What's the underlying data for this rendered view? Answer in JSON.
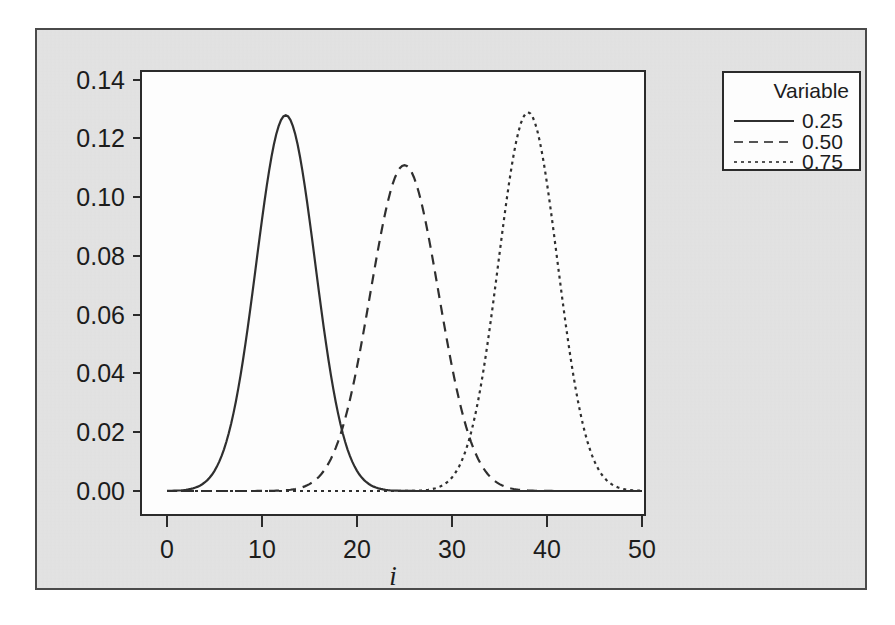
{
  "figure": {
    "panel_background": "#e3e3e3",
    "plot_background": "#fdfdfd",
    "border_color": "#4a4a4a"
  },
  "legend": {
    "title": "Variable",
    "entries": [
      {
        "label": "0.25",
        "style": "solid"
      },
      {
        "label": "0.50",
        "style": "dashed"
      },
      {
        "label": "0.75",
        "style": "dotted"
      }
    ]
  },
  "axes": {
    "x_label": "i",
    "y_label": "",
    "x_ticks": [
      "0",
      "10",
      "20",
      "30",
      "40",
      "50"
    ],
    "y_ticks": [
      "0.00",
      "0.02",
      "0.04",
      "0.06",
      "0.08",
      "0.10",
      "0.12",
      "0.14"
    ]
  },
  "chart_data": {
    "type": "line",
    "title": "",
    "subtitle": "",
    "xlabel": "i",
    "ylabel": "",
    "xlim": [
      0,
      50
    ],
    "ylim": [
      0.0,
      0.14
    ],
    "xticks": [
      0,
      10,
      20,
      30,
      40,
      50
    ],
    "yticks": [
      0.0,
      0.02,
      0.04,
      0.06,
      0.08,
      0.1,
      0.12,
      0.14
    ],
    "grid": false,
    "legend_position": "right-top",
    "legend_title": "Variable",
    "series": [
      {
        "name": "0.25",
        "linestyle": "solid",
        "color": "#2f2f2f",
        "peak_x": 12.5,
        "peak_y": 0.128,
        "sigma": 3.1,
        "x": [
          0,
          2,
          4,
          6,
          8,
          10,
          12,
          12.5,
          14,
          16,
          18,
          20,
          22,
          24,
          26,
          28,
          30,
          35,
          40,
          45,
          50
        ],
        "y": [
          0.0,
          0.0,
          0.0007,
          0.0062,
          0.0256,
          0.0719,
          0.1258,
          0.128,
          0.1175,
          0.0673,
          0.0258,
          0.0066,
          0.0011,
          0.0001,
          0.0,
          0.0,
          0.0,
          0.0,
          0.0,
          0.0,
          0.0
        ]
      },
      {
        "name": "0.50",
        "linestyle": "dashed",
        "color": "#555555",
        "peak_x": 25.0,
        "peak_y": 0.111,
        "sigma": 3.6,
        "x": [
          0,
          5,
          10,
          12,
          14,
          16,
          18,
          20,
          22,
          24,
          25,
          26,
          28,
          30,
          32,
          34,
          36,
          38,
          40,
          45,
          50
        ],
        "y": [
          0.0,
          0.0,
          0.0,
          0.0001,
          0.0009,
          0.0052,
          0.02,
          0.0533,
          0.0932,
          0.1097,
          0.111,
          0.108,
          0.0813,
          0.0441,
          0.0161,
          0.004,
          0.0007,
          0.0001,
          0.0,
          0.0,
          0.0
        ]
      },
      {
        "name": "0.75",
        "linestyle": "dotted",
        "color": "#555555",
        "peak_x": 38.0,
        "peak_y": 0.129,
        "sigma": 3.1,
        "x": [
          0,
          5,
          10,
          15,
          20,
          25,
          28,
          30,
          32,
          34,
          36,
          38,
          40,
          42,
          44,
          46,
          48,
          50
        ],
        "y": [
          0.0,
          0.0,
          0.0,
          0.0,
          0.0,
          0.0,
          0.0007,
          0.0062,
          0.026,
          0.0723,
          0.121,
          0.129,
          0.118,
          0.0683,
          0.0262,
          0.0067,
          0.0011,
          0.0001
        ]
      }
    ]
  }
}
